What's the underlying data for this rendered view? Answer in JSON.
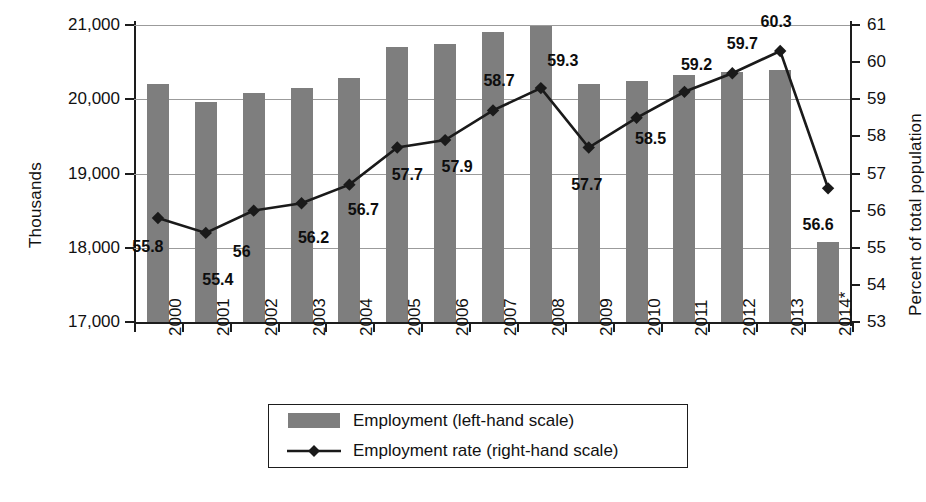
{
  "chart_data": {
    "type": "bar",
    "title": "",
    "categories": [
      "2000",
      "2001",
      "2002",
      "2003",
      "2004",
      "2005",
      "2006",
      "2007",
      "2008",
      "2009",
      "2010",
      "2011",
      "2012",
      "2013",
      "2014*"
    ],
    "xlabel": "",
    "series": [
      {
        "name": "Employment (left-hand scale)",
        "type": "bar",
        "axis": "left",
        "color": "#7e7e7e",
        "values": [
          20200,
          19960,
          20090,
          20150,
          20280,
          20700,
          20740,
          20900,
          20980,
          20210,
          20250,
          20320,
          20370,
          20400,
          18080
        ]
      },
      {
        "name": "Employment rate (right-hand scale)",
        "type": "line",
        "axis": "right",
        "color": "#1a1a1a",
        "marker": "diamond",
        "values": [
          55.8,
          55.4,
          56.0,
          56.2,
          56.7,
          57.7,
          57.9,
          58.7,
          59.3,
          57.7,
          58.5,
          59.2,
          59.7,
          60.3,
          56.6
        ],
        "labels": [
          "55.8",
          "55.4",
          "56",
          "56.2",
          "56.7",
          "57.7",
          "57.9",
          "58.7",
          "59.3",
          "57.7",
          "58.5",
          "59.2",
          "59.7",
          "60.3",
          "56.6"
        ]
      }
    ],
    "left_axis": {
      "label": "Thousands",
      "ylim": [
        17000,
        21000
      ],
      "ticks": [
        17000,
        18000,
        19000,
        20000,
        21000
      ],
      "tick_labels": [
        "17,000",
        "18,000",
        "19,000",
        "20,000",
        "21,000"
      ]
    },
    "right_axis": {
      "label": "Percent of total population",
      "ylim": [
        53,
        61
      ],
      "ticks": [
        53,
        54,
        55,
        56,
        57,
        58,
        59,
        60,
        61
      ],
      "tick_labels": [
        "53",
        "54",
        "55",
        "56",
        "57",
        "58",
        "59",
        "60",
        "61"
      ]
    },
    "grid": true,
    "gridlines_at": [
      18000,
      19000,
      20000,
      21000
    ],
    "legend_position": "bottom-center"
  },
  "legend": {
    "items": [
      {
        "label": "Employment (left-hand scale)",
        "key": "bar-swatch"
      },
      {
        "label": "Employment rate (right-hand scale)",
        "key": "line-marker-swatch"
      }
    ]
  }
}
